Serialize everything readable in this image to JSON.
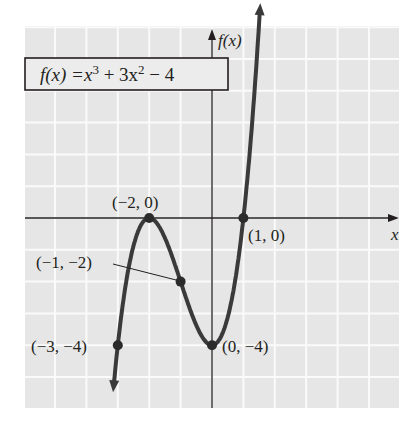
{
  "chart_data": {
    "type": "line",
    "title": "",
    "function_label": "f(x) = x³ + 3x² − 4",
    "function_label_parts": {
      "lhs": "f(x) =",
      "t1": "x",
      "t1_exp": "3",
      "t2": " + 3x",
      "t2_exp": "2",
      "t3": " − 4"
    },
    "xlabel": "x",
    "ylabel": "f(x)",
    "xlim": [
      -6,
      6
    ],
    "ylim": [
      -6,
      6
    ],
    "grid": true,
    "series": [
      {
        "name": "f(x) = x^3 + 3x^2 - 4",
        "x": [
          -3.2,
          -3,
          -2.5,
          -2,
          -1.5,
          -1,
          -0.5,
          0,
          0.5,
          1,
          1.5
        ],
        "y": [
          -6.05,
          -4,
          -1.875,
          0,
          -1.375,
          -2,
          -3.375,
          -4,
          -3.125,
          0,
          6.125
        ]
      }
    ],
    "marked_points": [
      {
        "x": -2,
        "y": 0,
        "label": "(−2, 0)"
      },
      {
        "x": 1,
        "y": 0,
        "label": "(1, 0)"
      },
      {
        "x": -1,
        "y": -2,
        "label": "(−1, −2)"
      },
      {
        "x": -3,
        "y": -4,
        "label": "(−3, −4)"
      },
      {
        "x": 0,
        "y": -4,
        "label": "(0, −4)"
      }
    ]
  },
  "colors": {
    "grid_bg": "#e6e6e6",
    "grid_line": "#fafafa",
    "curve": "#3a3a3a",
    "axis": "#231f20",
    "text": "#231f20"
  }
}
